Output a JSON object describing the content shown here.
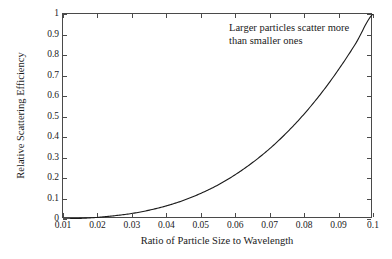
{
  "chart_data": {
    "type": "line",
    "title": "",
    "xlabel": "Ratio of Particle Size to Wavelength",
    "ylabel": "Relative Scattering Efficiency",
    "xlim": [
      0.01,
      0.1
    ],
    "ylim": [
      0,
      1
    ],
    "grid": false,
    "legend": "none",
    "xticks": [
      "0.01",
      "0.02",
      "0.03",
      "0.04",
      "0.05",
      "0.06",
      "0.07",
      "0.08",
      "0.09",
      "0.1"
    ],
    "xtick_values": [
      0.01,
      0.02,
      0.03,
      0.04,
      0.05,
      0.06,
      0.07,
      0.08,
      0.09,
      0.1
    ],
    "yticks": [
      "0",
      "0.1",
      "0.2",
      "0.3",
      "0.4",
      "0.5",
      "0.6",
      "0.7",
      "0.8",
      "0.9",
      "1"
    ],
    "ytick_values": [
      0,
      0.1,
      0.2,
      0.3,
      0.4,
      0.5,
      0.6,
      0.7,
      0.8,
      0.9,
      1
    ],
    "series": [
      {
        "name": "Relative scattering efficiency",
        "color": "#1a1a1a",
        "x": [
          0.01,
          0.015,
          0.02,
          0.025,
          0.03,
          0.035,
          0.04,
          0.045,
          0.05,
          0.055,
          0.06,
          0.065,
          0.07,
          0.075,
          0.08,
          0.085,
          0.09,
          0.095,
          0.1
        ],
        "values": [
          0.001,
          0.003,
          0.008,
          0.016,
          0.027,
          0.043,
          0.064,
          0.091,
          0.125,
          0.166,
          0.216,
          0.275,
          0.343,
          0.422,
          0.512,
          0.614,
          0.729,
          0.857,
          1.0
        ]
      }
    ],
    "annotations": [
      {
        "name": "scatter-note",
        "lines": [
          "Larger particles scatter more",
          "than smaller ones"
        ]
      }
    ]
  },
  "style": {
    "axis_color": "#4a4a4a",
    "curve_color": "#1a1a1a",
    "background": "#ffffff"
  }
}
